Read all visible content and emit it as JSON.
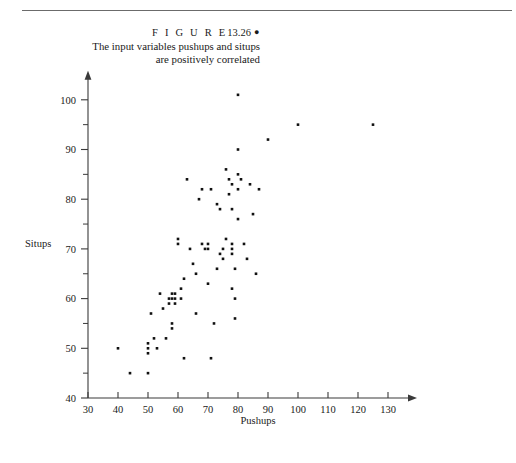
{
  "figure": {
    "label_word": "F I G U R E",
    "number": "13.26",
    "bullet": "●",
    "caption_line1": "The input variables pushups and situps",
    "caption_line2": "are positively correlated"
  },
  "chart_data": {
    "type": "scatter",
    "title": "",
    "xlabel": "Pushups",
    "ylabel": "Situps",
    "xlim": [
      30,
      130
    ],
    "ylim": [
      40,
      100
    ],
    "xticks": [
      30,
      40,
      50,
      60,
      70,
      80,
      90,
      100,
      110,
      120,
      130
    ],
    "yticks": [
      40,
      50,
      60,
      70,
      80,
      90,
      100
    ],
    "x_minor_step": 5,
    "y_minor_step": 5,
    "grid": false,
    "legend": null,
    "marker": "square",
    "marker_color": "#111111",
    "points": [
      [
        40,
        50
      ],
      [
        44,
        45
      ],
      [
        50,
        45
      ],
      [
        50,
        50
      ],
      [
        50,
        49
      ],
      [
        50,
        51
      ],
      [
        51,
        57
      ],
      [
        52,
        52
      ],
      [
        53,
        50
      ],
      [
        54,
        61
      ],
      [
        55,
        58
      ],
      [
        56,
        52
      ],
      [
        57,
        60
      ],
      [
        57,
        59
      ],
      [
        58,
        55
      ],
      [
        58,
        54
      ],
      [
        58,
        61
      ],
      [
        58,
        60
      ],
      [
        59,
        60
      ],
      [
        59,
        59
      ],
      [
        59,
        61
      ],
      [
        60,
        72
      ],
      [
        60,
        71
      ],
      [
        61,
        62
      ],
      [
        61,
        60
      ],
      [
        62,
        48
      ],
      [
        62,
        64
      ],
      [
        63,
        84
      ],
      [
        64,
        70
      ],
      [
        65,
        67
      ],
      [
        66,
        57
      ],
      [
        66,
        65
      ],
      [
        67,
        80
      ],
      [
        68,
        82
      ],
      [
        68,
        71
      ],
      [
        69,
        70
      ],
      [
        70,
        71
      ],
      [
        70,
        70
      ],
      [
        70,
        63
      ],
      [
        71,
        48
      ],
      [
        71,
        82
      ],
      [
        72,
        55
      ],
      [
        73,
        66
      ],
      [
        73,
        79
      ],
      [
        74,
        78
      ],
      [
        74,
        69
      ],
      [
        75,
        70
      ],
      [
        75,
        68
      ],
      [
        76,
        86
      ],
      [
        76,
        72
      ],
      [
        77,
        84
      ],
      [
        77,
        81
      ],
      [
        78,
        62
      ],
      [
        78,
        70
      ],
      [
        78,
        69
      ],
      [
        78,
        71
      ],
      [
        78,
        83
      ],
      [
        78,
        78
      ],
      [
        79,
        66
      ],
      [
        79,
        60
      ],
      [
        79,
        56
      ],
      [
        80,
        101
      ],
      [
        80,
        90
      ],
      [
        80,
        85
      ],
      [
        80,
        82
      ],
      [
        80,
        76
      ],
      [
        81,
        84
      ],
      [
        82,
        71
      ],
      [
        83,
        68
      ],
      [
        84,
        83
      ],
      [
        85,
        77
      ],
      [
        86,
        65
      ],
      [
        87,
        82
      ],
      [
        90,
        92
      ],
      [
        100,
        95
      ],
      [
        125,
        95
      ]
    ]
  }
}
